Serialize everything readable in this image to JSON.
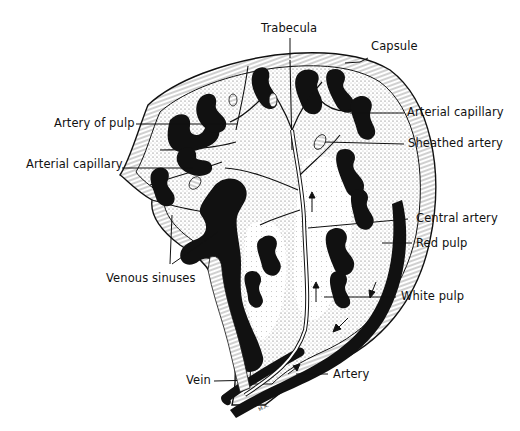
{
  "diagram": {
    "labels": {
      "trabecula": "Trabecula",
      "capsule": "Capsule",
      "artery_of_pulp": "Artery of pulp",
      "arterial_capillary_right": "Arterial capillary",
      "sheathed_artery": "Sheathed artery",
      "arterial_capillary_left": "Arterial capillary",
      "central_artery": "Central artery",
      "red_pulp": "Red pulp",
      "venous_sinuses": "Venous sinuses",
      "white_pulp": "White pulp",
      "vein": "Vein",
      "artery": "Artery"
    },
    "signature": "M.A.",
    "colors": {
      "ink": "#111111",
      "background": "#ffffff",
      "stipple": "#bdbdbd",
      "pale": "#f3f3f3"
    }
  }
}
